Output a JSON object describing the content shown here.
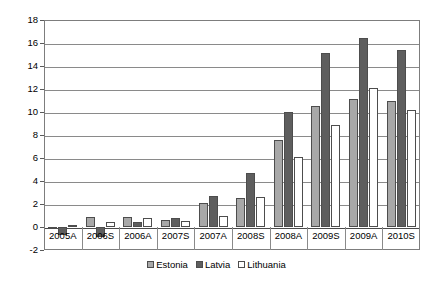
{
  "chart_data": {
    "type": "bar",
    "title": "",
    "subtitle": "",
    "xlabel": "",
    "ylabel": "",
    "ylim": [
      -2,
      18
    ],
    "ytick_labels": [
      "18",
      "16",
      "14",
      "12",
      "10",
      "8",
      "6",
      "4",
      "2",
      "0",
      "-2"
    ],
    "ytick_values": [
      18,
      16,
      14,
      12,
      10,
      8,
      6,
      4,
      2,
      0,
      -2
    ],
    "grid": true,
    "legend_position": "bottom-center",
    "categories": [
      "2005A",
      "2006S",
      "2006A",
      "2007S",
      "2007A",
      "2008S",
      "2008A",
      "2009S",
      "2009A",
      "2010S"
    ],
    "series": [
      {
        "name": "Estonia",
        "color": "#a8a8a8",
        "values": [
          -0.15,
          0.9,
          0.9,
          0.65,
          2.1,
          2.5,
          7.6,
          10.5,
          11.1,
          11.0
        ]
      },
      {
        "name": "Latvia",
        "color": "#5e5e5e",
        "values": [
          -0.7,
          -0.85,
          0.4,
          0.75,
          2.7,
          4.7,
          10.0,
          15.1,
          16.4,
          15.4
        ]
      },
      {
        "name": "Lithuania",
        "color": "#ffffff",
        "values": [
          0.2,
          0.4,
          0.75,
          0.55,
          1.0,
          2.6,
          6.1,
          8.9,
          12.1,
          10.2
        ]
      }
    ]
  },
  "legend": {
    "items": [
      {
        "label": "Estonia"
      },
      {
        "label": "Latvia"
      },
      {
        "label": "Lithuania"
      }
    ]
  }
}
